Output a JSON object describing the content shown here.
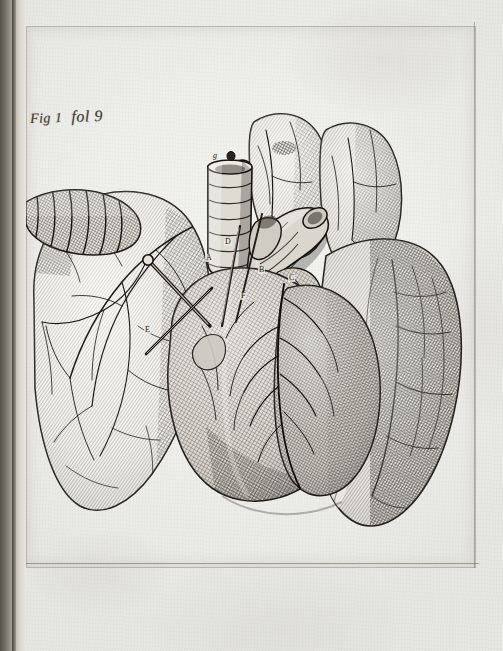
{
  "page": {
    "medium": "copperplate engraving on laid paper",
    "paper_color": "#eeeeeb",
    "ink_color": "#2a2620",
    "manuscript_ink_color": "#4a3b2a"
  },
  "inscription": {
    "figure_label": "Fig 1",
    "folio_reference": "fol 9",
    "full_text": "Fig 1  fol 9"
  },
  "plate": {
    "title": "Heart and lungs dissection",
    "subject": "thoracic viscera: heart with great vessels, trachea and lungs",
    "border_visible": true
  },
  "annotations": [
    {
      "letter": "g",
      "name": "trachea-top",
      "x": 186,
      "y": 130
    },
    {
      "letter": "A",
      "name": "pulmonary-artery",
      "x": 179,
      "y": 228
    },
    {
      "letter": "B",
      "name": "aorta",
      "x": 232,
      "y": 240
    },
    {
      "letter": "C",
      "name": "right-auricle",
      "x": 262,
      "y": 248
    },
    {
      "letter": "D",
      "name": "vena-cava",
      "x": 198,
      "y": 212
    },
    {
      "letter": "E",
      "name": "left-ventricle",
      "x": 118,
      "y": 300
    },
    {
      "letter": "F",
      "name": "pulmonary-vein",
      "x": 214,
      "y": 266
    }
  ],
  "structures": [
    {
      "name": "left-lung",
      "position": "left"
    },
    {
      "name": "right-lung",
      "position": "right"
    },
    {
      "name": "upper-lobes",
      "position": "top-center"
    },
    {
      "name": "heart",
      "position": "center"
    },
    {
      "name": "trachea",
      "position": "center-top"
    },
    {
      "name": "aortic-arch",
      "position": "center-top"
    },
    {
      "name": "dissection-probe",
      "position": "center-left"
    },
    {
      "name": "bronchus-segment",
      "position": "upper-left"
    }
  ],
  "gutter": {
    "side": "left",
    "is_binding_shadow": true
  }
}
